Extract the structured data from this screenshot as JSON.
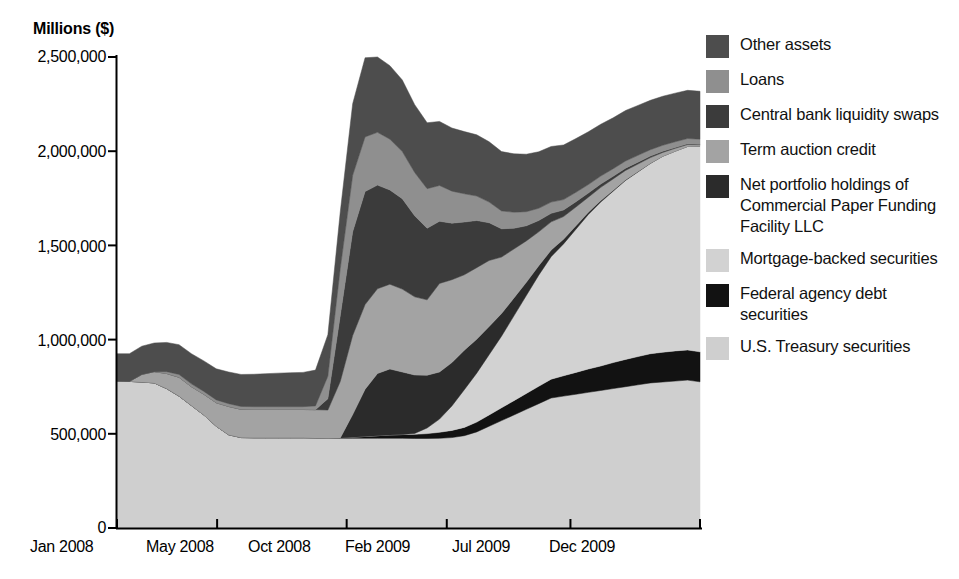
{
  "chart": {
    "type": "area",
    "title": "",
    "ylabel": "Millions ($)",
    "xlabel": "",
    "y_ticks": [
      "0",
      "500,000",
      "1,000,000",
      "1,500,000",
      "2,000,000",
      "2,500,000"
    ],
    "x_ticks": [
      "Jan 2008",
      "May 2008",
      "Oct 2008",
      "Feb 2009",
      "Jul 2009",
      "Dec 2009"
    ],
    "legend": [
      {
        "label": "Other assets",
        "color": "#4d4d4d"
      },
      {
        "label": "Loans",
        "color": "#8f8f8f"
      },
      {
        "label": "Central bank liquidity swaps",
        "color": "#3b3b3b"
      },
      {
        "label": "Term auction credit",
        "color": "#a3a3a3"
      },
      {
        "label": "Net portfolio holdings of Commercial Paper Funding Facility LLC",
        "color": "#2b2b2b"
      },
      {
        "label": "Mortgage-backed securities",
        "color": "#d2d2d2"
      },
      {
        "label": "Federal agency debt securities",
        "color": "#121212"
      },
      {
        "label": "U.S. Treasury securities",
        "color": "#cfcfcf"
      }
    ]
  },
  "chart_data": {
    "type": "area",
    "stacked": true,
    "xlabel": "",
    "ylabel": "Millions ($)",
    "ylim": [
      0,
      2500000
    ],
    "y_ticks": [
      0,
      500000,
      1000000,
      1500000,
      2000000,
      2500000
    ],
    "grid": false,
    "legend_position": "right",
    "x_tick_labels": [
      "Jan 2008",
      "May 2008",
      "Oct 2008",
      "Feb 2009",
      "Jul 2009",
      "Dec 2009"
    ],
    "x_tick_index": [
      0,
      17,
      39,
      56,
      77,
      99
    ],
    "x": [
      "2008-01",
      "2008-01",
      "2008-02",
      "2008-02",
      "2008-03",
      "2008-03",
      "2008-04",
      "2008-04",
      "2008-05",
      "2008-05",
      "2008-06",
      "2008-06",
      "2008-07",
      "2008-07",
      "2008-08",
      "2008-08",
      "2008-09",
      "2008-09",
      "2008-10",
      "2008-10",
      "2008-11",
      "2008-11",
      "2008-12",
      "2008-12",
      "2009-01",
      "2009-01",
      "2009-02",
      "2009-02",
      "2009-03",
      "2009-03",
      "2009-04",
      "2009-04",
      "2009-05",
      "2009-05",
      "2009-06",
      "2009-06",
      "2009-07",
      "2009-07",
      "2009-08",
      "2009-08",
      "2009-09",
      "2009-09",
      "2009-10",
      "2009-10",
      "2009-11",
      "2009-11",
      "2009-12",
      "2009-12"
    ],
    "series": [
      {
        "name": "U.S. Treasury securities",
        "color": "#cfcfcf",
        "values": [
          780000,
          778000,
          775000,
          770000,
          740000,
          700000,
          650000,
          600000,
          540000,
          495000,
          480000,
          479000,
          479000,
          479000,
          479000,
          479000,
          478000,
          476000,
          476000,
          476000,
          476000,
          476000,
          476000,
          476000,
          475000,
          475000,
          476000,
          480000,
          490000,
          510000,
          540000,
          570000,
          600000,
          630000,
          660000,
          690000,
          700000,
          710000,
          720000,
          730000,
          740000,
          750000,
          760000,
          770000,
          775000,
          780000,
          785000,
          776000
        ]
      },
      {
        "name": "Federal agency debt securities",
        "color": "#121212",
        "values": [
          0,
          0,
          0,
          0,
          0,
          0,
          0,
          0,
          0,
          0,
          0,
          0,
          0,
          0,
          0,
          0,
          0,
          0,
          2000,
          6000,
          10000,
          14000,
          18000,
          20000,
          22000,
          26000,
          32000,
          38000,
          44000,
          52000,
          60000,
          68000,
          76000,
          84000,
          92000,
          100000,
          108000,
          116000,
          124000,
          130000,
          138000,
          145000,
          150000,
          155000,
          158000,
          160000,
          160000,
          159000
        ]
      },
      {
        "name": "Mortgage-backed securities",
        "color": "#d2d2d2",
        "values": [
          0,
          0,
          0,
          0,
          0,
          0,
          0,
          0,
          0,
          0,
          0,
          0,
          0,
          0,
          0,
          0,
          0,
          0,
          0,
          0,
          0,
          0,
          0,
          0,
          5000,
          30000,
          70000,
          130000,
          200000,
          260000,
          320000,
          380000,
          450000,
          520000,
          590000,
          650000,
          700000,
          760000,
          820000,
          870000,
          910000,
          950000,
          980000,
          1010000,
          1040000,
          1060000,
          1080000,
          1091000
        ]
      },
      {
        "name": "Net portfolio holdings of Commercial Paper Funding Facility LLC",
        "color": "#2b2b2b",
        "values": [
          0,
          0,
          0,
          0,
          0,
          0,
          0,
          0,
          0,
          0,
          0,
          0,
          0,
          0,
          0,
          0,
          0,
          0,
          0,
          120000,
          250000,
          330000,
          350000,
          332000,
          310000,
          280000,
          250000,
          230000,
          210000,
          180000,
          150000,
          120000,
          95000,
          70000,
          50000,
          35000,
          25000,
          18000,
          12000,
          8000,
          5000,
          3000,
          2000,
          1000,
          500,
          200,
          100,
          0
        ]
      },
      {
        "name": "Term auction credit",
        "color": "#a3a3a3",
        "values": [
          0,
          0,
          40000,
          60000,
          80000,
          100000,
          100000,
          110000,
          125000,
          150000,
          150000,
          150000,
          150000,
          150000,
          150000,
          150000,
          150000,
          150000,
          300000,
          420000,
          450000,
          450000,
          450000,
          440000,
          415000,
          400000,
          470000,
          440000,
          400000,
          380000,
          350000,
          300000,
          260000,
          220000,
          180000,
          150000,
          120000,
          100000,
          80000,
          70000,
          60000,
          50000,
          40000,
          30000,
          20000,
          15000,
          10000,
          8000
        ]
      },
      {
        "name": "Central bank liquidity swaps",
        "color": "#3b3b3b",
        "values": [
          0,
          0,
          0,
          0,
          0,
          0,
          0,
          0,
          0,
          0,
          0,
          0,
          0,
          0,
          0,
          0,
          0,
          60000,
          350000,
          550000,
          600000,
          550000,
          500000,
          480000,
          430000,
          380000,
          330000,
          300000,
          280000,
          250000,
          200000,
          150000,
          110000,
          80000,
          60000,
          45000,
          35000,
          28000,
          22000,
          18000,
          14000,
          12000,
          10000,
          8000,
          6000,
          5000,
          4000,
          3000
        ]
      },
      {
        "name": "Loans",
        "color": "#8f8f8f",
        "values": [
          0,
          0,
          0,
          0,
          10000,
          15000,
          15000,
          15000,
          15000,
          15000,
          15000,
          15000,
          15000,
          15000,
          15000,
          15000,
          20000,
          120000,
          250000,
          300000,
          290000,
          280000,
          270000,
          250000,
          230000,
          210000,
          190000,
          170000,
          150000,
          130000,
          110000,
          95000,
          85000,
          75000,
          65000,
          60000,
          55000,
          50000,
          45000,
          42000,
          40000,
          38000,
          36000,
          34000,
          32000,
          30000,
          28000,
          27000
        ]
      },
      {
        "name": "Other assets",
        "color": "#4d4d4d",
        "values": [
          145000,
          147000,
          150000,
          152000,
          155000,
          158000,
          160000,
          162000,
          165000,
          168000,
          170000,
          172000,
          175000,
          178000,
          180000,
          182000,
          190000,
          220000,
          300000,
          380000,
          420000,
          400000,
          390000,
          380000,
          360000,
          350000,
          340000,
          335000,
          330000,
          325000,
          320000,
          315000,
          310000,
          305000,
          300000,
          295000,
          290000,
          285000,
          280000,
          275000,
          270000,
          268000,
          265000,
          262000,
          260000,
          258000,
          256000,
          254000
        ]
      }
    ],
    "annotations": {
      "peak_total": 2280000,
      "peak_period": "Dec 2008",
      "start_total": 925000,
      "end_total": 2265000
    }
  }
}
